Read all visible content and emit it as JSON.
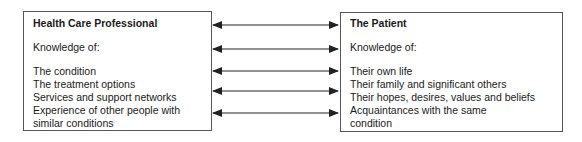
{
  "left": {
    "title": "Health Care Professional",
    "subtitle": "Knowledge of:",
    "items": [
      "The condition",
      "The treatment options",
      "Services and support networks",
      "Experience of other people with",
      "similar conditions"
    ]
  },
  "right": {
    "title": "The Patient",
    "subtitle": "Knowledge of:",
    "items": [
      "Their own life",
      "Their family and significant others",
      "Their hopes, desires, values and beliefs",
      "Acquaintances with the same",
      "condition"
    ]
  },
  "arrows": {
    "count": 5,
    "type": "bidirectional",
    "color": "#222222"
  }
}
